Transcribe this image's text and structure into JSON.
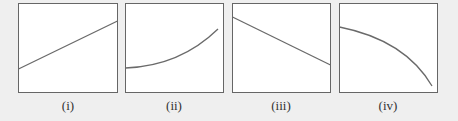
{
  "figure": {
    "panels": [
      {
        "label": "(i)",
        "shape": "linear-increasing"
      },
      {
        "label": "(ii)",
        "shape": "convex-increasing"
      },
      {
        "label": "(iii)",
        "shape": "linear-decreasing"
      },
      {
        "label": "(iv)",
        "shape": "concave-decreasing"
      }
    ],
    "colors": {
      "background": "#efefef",
      "panel_fill": "#ffffff",
      "stroke": "#666666",
      "curve": "#6a6a6a"
    }
  }
}
